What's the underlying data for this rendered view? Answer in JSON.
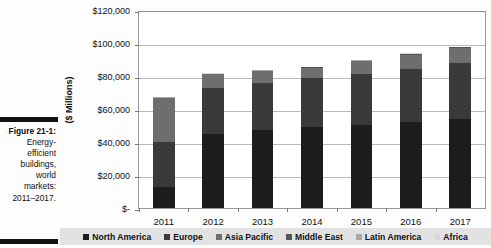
{
  "figure": {
    "caption_lead": "Figure 21-1:",
    "caption_lines": [
      "Energy-",
      "efficient",
      "buildings,",
      "world",
      "markets:",
      "2011–2017."
    ]
  },
  "chart_data": {
    "type": "bar",
    "stacked": true,
    "title": "",
    "xlabel": "",
    "ylabel": "($ Millions)",
    "categories": [
      "2011",
      "2012",
      "2013",
      "2014",
      "2015",
      "2016",
      "2017"
    ],
    "ytick_labels": [
      "$-",
      "$20,000",
      "$40,000",
      "$60,000",
      "$80,000",
      "$100,000",
      "$120,000"
    ],
    "ytick_values": [
      0,
      20000,
      40000,
      60000,
      80000,
      100000,
      120000
    ],
    "ylim": [
      0,
      120000
    ],
    "grid": true,
    "legend_position": "bottom",
    "series": [
      {
        "name": "North America",
        "color": "#1c1c1c",
        "values": [
          13000,
          45000,
          47500,
          49000,
          50500,
          52000,
          54000
        ]
      },
      {
        "name": "Europe",
        "color": "#3a3a3a",
        "values": [
          27000,
          27500,
          28500,
          29500,
          31000,
          32500,
          34000
        ]
      },
      {
        "name": "Asia Pacific",
        "color": "#6e6e6e",
        "values": [
          26500,
          8500,
          7000,
          6500,
          7500,
          8500,
          9000
        ]
      },
      {
        "name": "Middle East",
        "color": "#555555",
        "values": [
          300,
          300,
          300,
          300,
          300,
          300,
          300
        ]
      },
      {
        "name": "Latin America",
        "color": "#a8a8a8",
        "values": [
          200,
          200,
          250,
          250,
          300,
          300,
          350
        ]
      },
      {
        "name": "Africa",
        "color": "#d8d8d8",
        "values": [
          150,
          150,
          150,
          200,
          200,
          250,
          250
        ]
      }
    ],
    "totals": [
      67150,
      81650,
      83700,
      85750,
      89800,
      93850,
      97900
    ]
  }
}
